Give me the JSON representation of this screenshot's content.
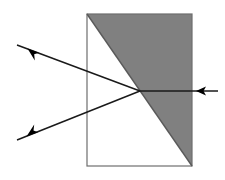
{
  "figure": {
    "type": "optical-ray-diagram",
    "canvas": {
      "width": 225,
      "height": 180,
      "background": "#ffffff"
    }
  },
  "colors": {
    "shaded_region_fill": "#808080",
    "outline_stroke": "#6e6e6e",
    "ray_stroke": "#1a1a1a",
    "arrow_fill": "#000000",
    "background": "#ffffff",
    "clear_region_fill": "#ffffff"
  },
  "geometry": {
    "block": {
      "name": "rectangular-block",
      "left": 87,
      "top": 14,
      "right": 192,
      "bottom": 166,
      "width": 105,
      "height": 152,
      "stroke_width": 1.2
    },
    "diagonal_interface": {
      "name": "diagonal-interface",
      "from": {
        "x": 87,
        "y": 14
      },
      "to": {
        "x": 192,
        "y": 166
      },
      "stroke_width": 1.4
    },
    "shaded_triangle": {
      "name": "shaded-wedge",
      "points": "87,14 192,14 192,166",
      "description": "Upper-right triangular half of the block, filled medium gray"
    },
    "clear_triangle": {
      "name": "clear-wedge",
      "points": "87,14 192,166 87,166",
      "description": "Lower-left triangular half of the block, unfilled white"
    },
    "focal_point": {
      "x": 140,
      "y": 91,
      "label": "refraction point on diagonal"
    },
    "ray_crossover": {
      "x": 72,
      "y": 91,
      "label": "crossover of the two exiting rays"
    }
  },
  "rays": [
    {
      "id": "incident-ray-right",
      "name": "incident-ray",
      "direction": "leftward",
      "from": {
        "x": 218,
        "y": 91
      },
      "to": {
        "x": 140,
        "y": 91
      },
      "stroke_width": 1.6,
      "arrow": {
        "name": "arrow-left",
        "tip": {
          "x": 196,
          "y": 91
        },
        "points": "196,91 205,86 203,91 205,96",
        "rotation_deg": 180
      }
    },
    {
      "id": "exit-ray-upper-left",
      "name": "exit-ray-upper",
      "direction": "up-left",
      "from": {
        "x": 140,
        "y": 91
      },
      "to": {
        "x": 17,
        "y": 45
      },
      "stroke_width": 1.5,
      "arrow": {
        "name": "arrow-up-left",
        "tip": {
          "x": 28,
          "y": 49
        },
        "points": "28,49 38,51 34,54 35,60",
        "rotation_deg": 200
      }
    },
    {
      "id": "exit-ray-lower-left",
      "name": "exit-ray-lower",
      "direction": "down-left",
      "from": {
        "x": 140,
        "y": 91
      },
      "to": {
        "x": 17,
        "y": 140
      },
      "stroke_width": 1.5,
      "arrow": {
        "name": "arrow-down-left",
        "tip": {
          "x": 27,
          "y": 136
        },
        "points": "27,136 37,134 34,131 35,125",
        "rotation_deg": 160
      }
    }
  ]
}
